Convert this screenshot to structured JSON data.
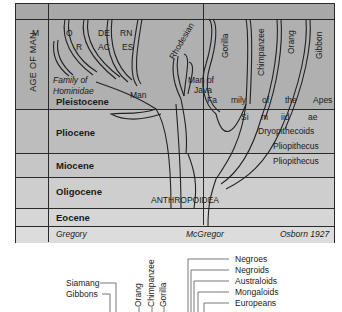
{
  "chart": {
    "title_column_label": "AGE OF MAN",
    "epochs": [
      {
        "name": "Pleistocene"
      },
      {
        "name": "Pliocene"
      },
      {
        "name": "Miocene"
      },
      {
        "name": "Oligocene"
      },
      {
        "name": "Eocene"
      }
    ],
    "upper_labels": {
      "modern_races_letters": [
        "M",
        "O",
        "DE",
        "RN",
        "R",
        "AC",
        "ES"
      ],
      "family_hominidae": "Family of",
      "family_hominidae_2": "Hominidae",
      "man": "Man",
      "rhodesian": "Rhodesian",
      "man_of_java_1": "Man of",
      "man_of_java_2": "Java",
      "gorilla": "Gorilla",
      "chimpanzee": "Chimpanzee",
      "orang": "Orang",
      "gibbon": "Gibbon",
      "family_apes": [
        "Fa",
        "mily",
        "of",
        "the",
        "Apes"
      ],
      "simiidae": [
        "Si",
        "m",
        "iid",
        "ae"
      ],
      "dryopithecoids": "Dryopithecoids",
      "pliopithecus_1": "Pliopithecus",
      "pliopithecus_2": "Pliopithecus",
      "anthropoidea": "ANTHROPOIDEA"
    },
    "credits": {
      "left": "Gregory",
      "middle": "McGregor",
      "right": "Osborn 1927"
    },
    "colors": {
      "line": "#2a2a2a",
      "background_top": "#a8a8a8",
      "background_bottom": "#dcdcdc"
    }
  },
  "lower_tree": {
    "left_labels": [
      "Siamang",
      "Gibbons"
    ],
    "ape_labels": [
      "Orang",
      "Chimpanzee",
      "Gorilla"
    ],
    "right_labels": [
      "Negroes",
      "Negroids",
      "Australoids",
      "Mongaloids",
      "Europeans"
    ]
  }
}
